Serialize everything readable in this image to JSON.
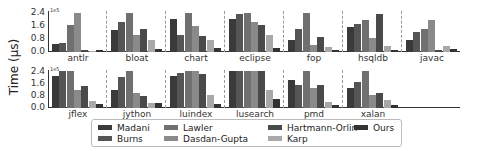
{
  "chart_data": {
    "type": "bar",
    "title": "",
    "ylabel": "Time (μs)",
    "y_scale_label": "1e5",
    "yticks": [
      "0.0",
      "0.8",
      "1.6",
      "2.4"
    ],
    "ylim": [
      0,
      2.4
    ],
    "grid": false,
    "legend_position": "bottom",
    "series_names": [
      "Madani",
      "Burns",
      "Lawler",
      "Dasdan-Gupta",
      "Hartmann-Orlin",
      "Karp",
      "Ours"
    ],
    "series_colors": [
      "#3a3a3a",
      "#555555",
      "#707070",
      "#8a8a8a",
      "#4a4a4a",
      "#a8a8a8",
      "#333333"
    ],
    "rows": [
      {
        "groups": [
          {
            "name": "antlr",
            "values": [
              0.5,
              0.55,
              1.6,
              2.35,
              0.15,
              0.05,
              0.1
            ]
          },
          {
            "name": "bloat",
            "values": [
              1.3,
              1.8,
              2.35,
              1.0,
              1.4,
              0.75,
              0.2
            ]
          },
          {
            "name": "chart",
            "values": [
              2.0,
              1.0,
              2.35,
              1.55,
              0.95,
              0.7,
              0.25
            ]
          },
          {
            "name": "eclipse",
            "values": [
              2.0,
              2.3,
              2.35,
              1.8,
              1.6,
              1.05,
              0.25
            ]
          },
          {
            "name": "fop",
            "values": [
              0.75,
              1.4,
              2.35,
              0.45,
              0.9,
              0.3,
              0.15
            ]
          },
          {
            "name": "hsqldb",
            "values": [
              1.5,
              1.7,
              1.9,
              0.85,
              2.3,
              0.35,
              0.15
            ]
          },
          {
            "name": "javac",
            "values": [
              0.7,
              1.2,
              1.4,
              1.9,
              0.15,
              0.35,
              0.2
            ]
          }
        ]
      },
      {
        "groups": [
          {
            "name": "jflex",
            "values": [
              2.1,
              2.4,
              2.4,
              1.2,
              1.4,
              0.45,
              0.25
            ]
          },
          {
            "name": "jython",
            "values": [
              1.2,
              2.0,
              2.4,
              0.95,
              0.8,
              0.3,
              0.3
            ]
          },
          {
            "name": "luindex",
            "values": [
              2.1,
              2.3,
              2.4,
              2.4,
              2.2,
              0.85,
              0.25
            ]
          },
          {
            "name": "lusearch",
            "values": [
              2.4,
              2.4,
              2.4,
              2.4,
              2.4,
              1.2,
              0.6
            ]
          },
          {
            "name": "pmd",
            "values": [
              1.8,
              1.5,
              2.4,
              1.3,
              1.5,
              0.4,
              0.2
            ]
          },
          {
            "name": "xalan",
            "values": [
              1.3,
              1.7,
              2.4,
              0.85,
              0.95,
              0.5,
              0.2
            ]
          }
        ]
      }
    ]
  },
  "axis": {
    "ylabel": "Time (μs)",
    "exp": "1e5",
    "ticks": [
      "2.4",
      "1.6",
      "0.8",
      "0.0"
    ]
  },
  "legend": {
    "items": [
      {
        "label": "Madani",
        "color": "#3a3a3a"
      },
      {
        "label": "Burns",
        "color": "#555555"
      },
      {
        "label": "Lawler",
        "color": "#707070"
      },
      {
        "label": "Dasdan-Gupta",
        "color": "#8a8a8a"
      },
      {
        "label": "Hartmann-Orlin",
        "color": "#4a4a4a"
      },
      {
        "label": "Karp",
        "color": "#a8a8a8"
      },
      {
        "label": "Ours",
        "color": "#333333"
      }
    ]
  }
}
